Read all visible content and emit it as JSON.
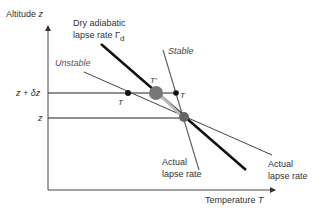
{
  "diagram": {
    "y_axis_label": "Altitude",
    "y_axis_var": "z",
    "x_axis_label": "Temperature",
    "x_axis_var": "T",
    "tick_upper": "z + δz",
    "tick_lower": "z",
    "dry_adiabatic_line1": "Dry adiabatic",
    "dry_adiabatic_line2": "lapse rate Γ",
    "dry_adiabatic_sub": "d",
    "unstable_label": "Unstable",
    "stable_label": "Stable",
    "point_T_left": "T",
    "point_T_prime": "T′",
    "point_T_right": "T",
    "actual_lapse_left_1": "Actual",
    "actual_lapse_left_2": "lapse rate",
    "actual_lapse_right_1": "Actual",
    "actual_lapse_right_2": "lapse rate",
    "colors": {
      "dry_adiabatic": "#111111",
      "actual_lines": "#555555",
      "parcel": "#777777",
      "arrow": "#bbbbbb"
    }
  }
}
